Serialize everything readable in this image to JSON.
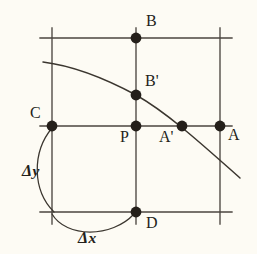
{
  "figure": {
    "background_color": "#fdfbf4",
    "ink_color": "#241f1a",
    "line_color": "#4a453f",
    "width": 257,
    "height": 254
  },
  "grid": {
    "vertical_lines": [
      {
        "name": "left-vertical-line",
        "x": 52,
        "y1": 28,
        "y2": 224
      },
      {
        "name": "middle-vertical-line",
        "x": 136,
        "y1": 28,
        "y2": 224
      },
      {
        "name": "right-vertical-line",
        "x": 220,
        "y1": 28,
        "y2": 224
      }
    ],
    "horizontal_lines": [
      {
        "name": "top-horizontal-line",
        "y": 38,
        "x1": 40,
        "x2": 232
      },
      {
        "name": "middle-horizontal-line",
        "y": 126,
        "x1": 40,
        "x2": 232
      },
      {
        "name": "bottom-horizontal-line",
        "y": 212,
        "x1": 40,
        "x2": 232
      }
    ]
  },
  "curve": {
    "name": "descending-curve",
    "description": "smooth concave-down curve passing through B-prime and A-prime",
    "path": "M 43,62 C 75,66 108,80 136,95 C 168,113 205,147 240,178"
  },
  "points": [
    {
      "id": "B",
      "label": "B",
      "x": 136,
      "y": 38,
      "label_x": 146,
      "label_y": 26
    },
    {
      "id": "Bp",
      "label": "B'",
      "x": 136,
      "y": 95,
      "label_x": 145,
      "label_y": 86
    },
    {
      "id": "C",
      "label": "C",
      "x": 52,
      "y": 126,
      "label_x": 30,
      "label_y": 118
    },
    {
      "id": "P",
      "label": "P",
      "x": 136,
      "y": 126,
      "label_x": 120,
      "label_y": 142
    },
    {
      "id": "Ap",
      "label": "A'",
      "x": 182,
      "y": 126,
      "label_x": 159,
      "label_y": 142
    },
    {
      "id": "A",
      "label": "A",
      "x": 220,
      "y": 126,
      "label_x": 228,
      "label_y": 140
    },
    {
      "id": "D",
      "label": "D",
      "x": 136,
      "y": 212,
      "label_x": 146,
      "label_y": 228
    }
  ],
  "point_radius": 5.4,
  "measurements": [
    {
      "id": "delta-y",
      "glyph": "Δ",
      "variable": "y",
      "arc_path": "M 52,128 C 32,152 32,190 54,212",
      "label_x": 22,
      "label_y": 176
    },
    {
      "id": "delta-x",
      "glyph": "Δ",
      "variable": "x",
      "arc_path": "M 52,214 C 66,238 112,238 134,214",
      "label_x": 78,
      "label_y": 243
    }
  ]
}
